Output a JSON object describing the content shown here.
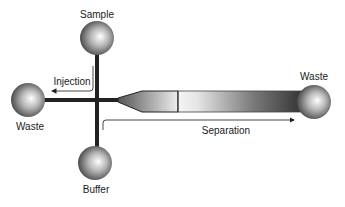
{
  "diagram": {
    "reservoirs": [
      {
        "id": "sample",
        "label": "Sample"
      },
      {
        "id": "waste-left",
        "label": "Waste"
      },
      {
        "id": "buffer",
        "label": "Buffer"
      },
      {
        "id": "waste-right",
        "label": "Waste"
      }
    ],
    "arrows": [
      {
        "id": "injection",
        "label": "Injection",
        "direction": "left"
      },
      {
        "id": "separation",
        "label": "Separation",
        "direction": "right"
      }
    ],
    "colors": {
      "channel": "#222222",
      "sphere_light": "#ffffff",
      "sphere_dark": "#3a3a3a",
      "arrow": "#333333"
    }
  }
}
